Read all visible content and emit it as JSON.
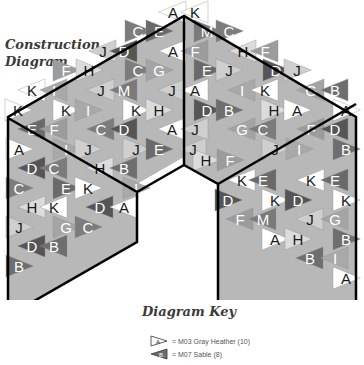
{
  "title": {
    "line1": "Construction",
    "line2": "Diagram"
  },
  "key": {
    "title": "Diagram Key",
    "items": [
      {
        "letter": "A",
        "label": "= M03 Gray Heather (10)",
        "color": "#ffffff",
        "text_color": "#222222"
      },
      {
        "letter": "B",
        "label": "= M07 Sable (8)",
        "color": "#6e6e6e",
        "text_color": "#ffffff"
      }
    ]
  },
  "colors": {
    "outline": "#000000",
    "light": "#ffffff",
    "pale": "#d0d0d0",
    "mid": "#a8a8a8",
    "dark": "#7a7a7a",
    "darker": "#5a5a5a"
  },
  "labels": [
    {
      "t": "A",
      "x": 173,
      "y": 12,
      "d": 0
    },
    {
      "t": "K",
      "x": 195,
      "y": 12,
      "d": 0
    },
    {
      "t": "C",
      "x": 138,
      "y": 31,
      "d": 1
    },
    {
      "t": "E",
      "x": 159,
      "y": 31,
      "d": 1
    },
    {
      "t": "M",
      "x": 207,
      "y": 31,
      "d": 1
    },
    {
      "t": "C",
      "x": 229,
      "y": 31,
      "d": 1
    },
    {
      "t": "J",
      "x": 103,
      "y": 51,
      "d": 0
    },
    {
      "t": "D",
      "x": 124,
      "y": 51,
      "d": 1
    },
    {
      "t": "A",
      "x": 173,
      "y": 51,
      "d": 0
    },
    {
      "t": "F",
      "x": 195,
      "y": 51,
      "d": 1
    },
    {
      "t": "H",
      "x": 243,
      "y": 51,
      "d": 0
    },
    {
      "t": "F",
      "x": 265,
      "y": 51,
      "d": 1
    },
    {
      "t": "F",
      "x": 66,
      "y": 70,
      "d": 1
    },
    {
      "t": "H",
      "x": 89,
      "y": 70,
      "d": 0
    },
    {
      "t": "C",
      "x": 138,
      "y": 70,
      "d": 1
    },
    {
      "t": "G",
      "x": 159,
      "y": 70,
      "d": 1
    },
    {
      "t": "E",
      "x": 207,
      "y": 70,
      "d": 1
    },
    {
      "t": "J",
      "x": 229,
      "y": 70,
      "d": 0
    },
    {
      "t": "D",
      "x": 276,
      "y": 70,
      "d": 1
    },
    {
      "t": "J",
      "x": 297,
      "y": 70,
      "d": 0
    },
    {
      "t": "K",
      "x": 32,
      "y": 90,
      "d": 0
    },
    {
      "t": "I",
      "x": 54,
      "y": 90,
      "d": 1
    },
    {
      "t": "J",
      "x": 101,
      "y": 90,
      "d": 0
    },
    {
      "t": "M",
      "x": 124,
      "y": 90,
      "d": 1
    },
    {
      "t": "J",
      "x": 172,
      "y": 90,
      "d": 0
    },
    {
      "t": "A",
      "x": 195,
      "y": 90,
      "d": 0
    },
    {
      "t": "I",
      "x": 242,
      "y": 90,
      "d": 1
    },
    {
      "t": "K",
      "x": 265,
      "y": 90,
      "d": 0
    },
    {
      "t": "G",
      "x": 311,
      "y": 90,
      "d": 1
    },
    {
      "t": "B",
      "x": 335,
      "y": 90,
      "d": 1
    },
    {
      "t": "K",
      "x": 18,
      "y": 110,
      "d": 0
    },
    {
      "t": "K",
      "x": 66,
      "y": 110,
      "d": 0
    },
    {
      "t": "I",
      "x": 88,
      "y": 110,
      "d": 1
    },
    {
      "t": "K",
      "x": 136,
      "y": 110,
      "d": 0
    },
    {
      "t": "H",
      "x": 159,
      "y": 110,
      "d": 0
    },
    {
      "t": "D",
      "x": 207,
      "y": 110,
      "d": 1
    },
    {
      "t": "B",
      "x": 229,
      "y": 110,
      "d": 1
    },
    {
      "t": "H",
      "x": 274,
      "y": 110,
      "d": 0
    },
    {
      "t": "A",
      "x": 297,
      "y": 110,
      "d": 0
    },
    {
      "t": "A",
      "x": 346,
      "y": 110,
      "d": 0
    },
    {
      "t": "E",
      "x": 32,
      "y": 129,
      "d": 1
    },
    {
      "t": "F",
      "x": 54,
      "y": 129,
      "d": 1
    },
    {
      "t": "C",
      "x": 101,
      "y": 129,
      "d": 1
    },
    {
      "t": "D",
      "x": 124,
      "y": 129,
      "d": 1
    },
    {
      "t": "A",
      "x": 172,
      "y": 129,
      "d": 0
    },
    {
      "t": "J",
      "x": 195,
      "y": 129,
      "d": 0
    },
    {
      "t": "G",
      "x": 242,
      "y": 129,
      "d": 1
    },
    {
      "t": "C",
      "x": 263,
      "y": 129,
      "d": 1
    },
    {
      "t": "F",
      "x": 311,
      "y": 129,
      "d": 1
    },
    {
      "t": "D",
      "x": 335,
      "y": 129,
      "d": 1
    },
    {
      "t": "A",
      "x": 19,
      "y": 149,
      "d": 0
    },
    {
      "t": "I",
      "x": 66,
      "y": 149,
      "d": 1
    },
    {
      "t": "J",
      "x": 88,
      "y": 149,
      "d": 0
    },
    {
      "t": "J",
      "x": 136,
      "y": 149,
      "d": 0
    },
    {
      "t": "E",
      "x": 159,
      "y": 149,
      "d": 1
    },
    {
      "t": "J",
      "x": 193,
      "y": 149,
      "d": 0
    },
    {
      "t": "H",
      "x": 206,
      "y": 160,
      "d": 0
    },
    {
      "t": "F",
      "x": 230,
      "y": 160,
      "d": 1
    },
    {
      "t": "J",
      "x": 275,
      "y": 149,
      "d": 0
    },
    {
      "t": "I",
      "x": 299,
      "y": 149,
      "d": 1
    },
    {
      "t": "B",
      "x": 346,
      "y": 149,
      "d": 1
    },
    {
      "t": "D",
      "x": 32,
      "y": 168,
      "d": 1
    },
    {
      "t": "C",
      "x": 54,
      "y": 168,
      "d": 1
    },
    {
      "t": "H",
      "x": 100,
      "y": 168,
      "d": 0
    },
    {
      "t": "B",
      "x": 124,
      "y": 168,
      "d": 1
    },
    {
      "t": "K",
      "x": 242,
      "y": 180,
      "d": 0
    },
    {
      "t": "E",
      "x": 263,
      "y": 180,
      "d": 1
    },
    {
      "t": "K",
      "x": 311,
      "y": 180,
      "d": 0
    },
    {
      "t": "E",
      "x": 335,
      "y": 180,
      "d": 1
    },
    {
      "t": "C",
      "x": 19,
      "y": 188,
      "d": 1
    },
    {
      "t": "E",
      "x": 66,
      "y": 188,
      "d": 1
    },
    {
      "t": "K",
      "x": 88,
      "y": 188,
      "d": 0
    },
    {
      "t": "I",
      "x": 136,
      "y": 188,
      "d": 1
    },
    {
      "t": "H",
      "x": 32,
      "y": 207,
      "d": 0
    },
    {
      "t": "K",
      "x": 54,
      "y": 207,
      "d": 0
    },
    {
      "t": "D",
      "x": 100,
      "y": 207,
      "d": 1
    },
    {
      "t": "A",
      "x": 124,
      "y": 207,
      "d": 0
    },
    {
      "t": "D",
      "x": 228,
      "y": 200,
      "d": 1
    },
    {
      "t": "K",
      "x": 275,
      "y": 200,
      "d": 0
    },
    {
      "t": "D",
      "x": 298,
      "y": 200,
      "d": 1
    },
    {
      "t": "K",
      "x": 346,
      "y": 200,
      "d": 0
    },
    {
      "t": "J",
      "x": 19,
      "y": 227,
      "d": 0
    },
    {
      "t": "G",
      "x": 66,
      "y": 227,
      "d": 1
    },
    {
      "t": "C",
      "x": 88,
      "y": 227,
      "d": 1
    },
    {
      "t": "F",
      "x": 240,
      "y": 219,
      "d": 1
    },
    {
      "t": "M",
      "x": 263,
      "y": 219,
      "d": 1
    },
    {
      "t": "J",
      "x": 310,
      "y": 219,
      "d": 0
    },
    {
      "t": "G",
      "x": 335,
      "y": 219,
      "d": 1
    },
    {
      "t": "D",
      "x": 32,
      "y": 246,
      "d": 1
    },
    {
      "t": "B",
      "x": 54,
      "y": 246,
      "d": 1
    },
    {
      "t": "A",
      "x": 275,
      "y": 239,
      "d": 0
    },
    {
      "t": "H",
      "x": 298,
      "y": 239,
      "d": 0
    },
    {
      "t": "B",
      "x": 346,
      "y": 239,
      "d": 1
    },
    {
      "t": "B",
      "x": 19,
      "y": 266,
      "d": 1
    },
    {
      "t": "B",
      "x": 310,
      "y": 258,
      "d": 1
    },
    {
      "t": "I",
      "x": 335,
      "y": 258,
      "d": 1
    },
    {
      "t": "A",
      "x": 346,
      "y": 278,
      "d": 0
    }
  ]
}
